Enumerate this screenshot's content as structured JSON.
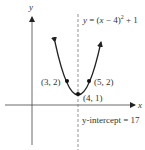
{
  "diagram": {
    "type": "parabola-graph",
    "equation": {
      "prefix": "y = (x − 4)",
      "exponent": "2",
      "suffix": " + 1"
    },
    "axes": {
      "x_label": "x",
      "y_label": "y"
    },
    "vertex_label": "(4, 1)",
    "points": [
      {
        "label": "(3, 2)",
        "x": 3,
        "y": 2
      },
      {
        "label": "(5, 2)",
        "x": 5,
        "y": 2
      },
      {
        "label": "(4, 1)",
        "x": 4,
        "y": 1
      }
    ],
    "axis_of_symmetry": "x = 4",
    "y_intercept_text": "y-intercept = 17",
    "colors": {
      "curve": "#222222",
      "axes": "#444444",
      "dashed": "#777777",
      "text": "#333333"
    }
  }
}
